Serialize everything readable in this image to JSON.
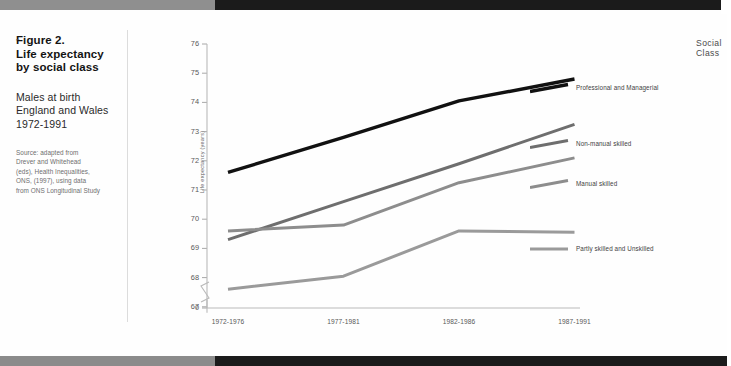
{
  "caption": {
    "tick_glyph": "⌐",
    "title_line1": "Figure 2.",
    "title_line2": "Life expectancy",
    "title_line3": "by social class",
    "subtitle_line1": "Males at birth",
    "subtitle_line2": "England and Wales",
    "subtitle_line3": "1972-1991",
    "source_line1": "Source: adapted from",
    "source_line2": "Drever and Whitehead",
    "source_line3": "(eds), Health Inequalities,",
    "source_line4": "ONS, (1997), using data",
    "source_line5": "from ONS Longitudinal Study"
  },
  "legend": {
    "title": "Social Class"
  },
  "chart_data": {
    "type": "line",
    "title": "Life expectancy by social class",
    "subtitle": "Males at birth, England and Wales, 1972-1991",
    "xlabel": "",
    "ylabel": "Life expectancy (years)",
    "categories": [
      "1972-1976",
      "1977-1981",
      "1982-1986",
      "1987-1991"
    ],
    "yticks": [
      0,
      67,
      68,
      69,
      70,
      71,
      72,
      73,
      74,
      75,
      76
    ],
    "ylim": [
      67,
      76
    ],
    "y_axis_break": true,
    "grid": false,
    "legend_position": "right-top",
    "series": [
      {
        "name": "Professional and Managerial",
        "color": "#111111",
        "values": [
          71.6,
          72.8,
          74.05,
          74.8
        ]
      },
      {
        "name": "Non-manual skilled",
        "color": "#6e6e6e",
        "values": [
          69.3,
          70.6,
          71.9,
          73.25
        ]
      },
      {
        "name": "Manual skilled",
        "color": "#8d8d8d",
        "values": [
          69.6,
          69.8,
          71.25,
          72.1
        ]
      },
      {
        "name": "Partly skilled and Unskilled",
        "color": "#9a9a9a",
        "values": [
          67.6,
          68.05,
          69.6,
          69.55
        ]
      }
    ]
  }
}
